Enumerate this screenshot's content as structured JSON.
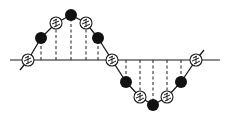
{
  "diagram": {
    "type": "sampled-sine-wave",
    "colors": {
      "background": "#ffffff",
      "line": "#1a1a1a",
      "solid_marker": "#111111",
      "patterned_marker_fill": "#ffffff"
    },
    "baseline": {
      "x1": 10,
      "x2": 220,
      "y": 60
    },
    "samples": [
      {
        "x": 28,
        "y": 60,
        "style": "patterned"
      },
      {
        "x": 41,
        "y": 38,
        "style": "solid"
      },
      {
        "x": 56,
        "y": 23,
        "style": "patterned"
      },
      {
        "x": 71,
        "y": 15,
        "style": "solid"
      },
      {
        "x": 86,
        "y": 23,
        "style": "patterned"
      },
      {
        "x": 98,
        "y": 38,
        "style": "solid"
      },
      {
        "x": 112,
        "y": 60,
        "style": "patterned"
      },
      {
        "x": 126,
        "y": 82,
        "style": "solid"
      },
      {
        "x": 140,
        "y": 97,
        "style": "patterned"
      },
      {
        "x": 153,
        "y": 105,
        "style": "solid"
      },
      {
        "x": 167,
        "y": 97,
        "style": "patterned"
      },
      {
        "x": 181,
        "y": 82,
        "style": "solid"
      },
      {
        "x": 196,
        "y": 60,
        "style": "patterned"
      }
    ],
    "marker_radius": 6
  }
}
